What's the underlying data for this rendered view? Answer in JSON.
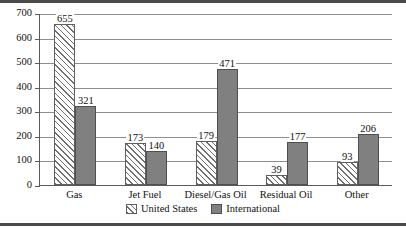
{
  "chart_data": {
    "type": "bar",
    "title": "",
    "subtitle": "",
    "xlabel": "",
    "ylabel": "",
    "ylim": [
      0,
      700
    ],
    "ytick_step": 100,
    "yticks": [
      "700",
      "600",
      "500",
      "400",
      "300",
      "200",
      "100",
      "0"
    ],
    "grid": true,
    "grid_axis": "y",
    "legend_position": "bottom-center",
    "orientation": "vertical",
    "grouping": "clustered",
    "categories": [
      "Gas",
      "Jet Fuel",
      "Diesel/Gas Oil",
      "Residual Oil",
      "Other"
    ],
    "series": [
      {
        "name": "United States",
        "fill": "diagonal-hatch",
        "color": "#ffffff",
        "values": [
          655,
          173,
          179,
          39,
          93
        ],
        "labels": [
          "655",
          "173",
          "179",
          "39",
          "93"
        ]
      },
      {
        "name": "International",
        "fill": "solid",
        "color": "#808080",
        "values": [
          321,
          140,
          471,
          177,
          206
        ],
        "labels": [
          "321",
          "140",
          "471",
          "177",
          "206"
        ]
      }
    ],
    "annotations": []
  },
  "legend": {
    "items": [
      {
        "label": "United States",
        "swatch": "hatched-swatch"
      },
      {
        "label": "International",
        "swatch": "gray-swatch"
      }
    ]
  },
  "colors": {
    "international_bar": "#808080",
    "bar_outline": "#5f5f5f",
    "gridline": "#8e8e8e",
    "axis": "#5a5a5a",
    "frame_rule": "#4a4a4a",
    "text": "#111111",
    "background": "#ffffff"
  }
}
